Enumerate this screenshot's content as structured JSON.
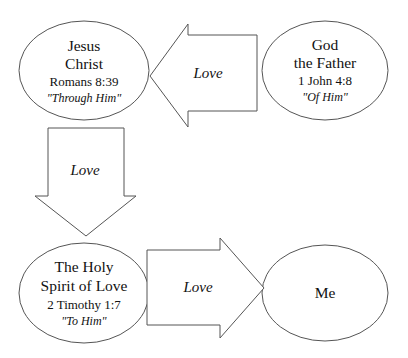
{
  "diagram": {
    "background_color": "#ffffff",
    "outline_color": "#555555",
    "text_color": "#111111",
    "nodes": [
      {
        "id": "jesus-christ",
        "shape": "ellipse",
        "line1": "Jesus",
        "line2": "Christ",
        "reference": "Romans 8:39",
        "quote": "\"Through Him\""
      },
      {
        "id": "god-the-father",
        "shape": "ellipse",
        "line1": "God",
        "line2": "the Father",
        "reference": "1 John 4:8",
        "quote": "\"Of Him\""
      },
      {
        "id": "holy-spirit",
        "shape": "ellipse",
        "line1": "The Holy",
        "line2": "Spirit of Love",
        "reference": "2 Timothy 1:7",
        "quote": "\"To Him\""
      },
      {
        "id": "me",
        "shape": "ellipse",
        "line1": "Me"
      }
    ],
    "arrows": [
      {
        "id": "father-to-son",
        "label": "Love",
        "direction": "left",
        "from": "god-the-father",
        "to": "jesus-christ"
      },
      {
        "id": "son-to-spirit",
        "label": "Love",
        "direction": "down",
        "from": "jesus-christ",
        "to": "holy-spirit"
      },
      {
        "id": "spirit-to-me",
        "label": "Love",
        "direction": "right",
        "from": "holy-spirit",
        "to": "me"
      }
    ]
  }
}
